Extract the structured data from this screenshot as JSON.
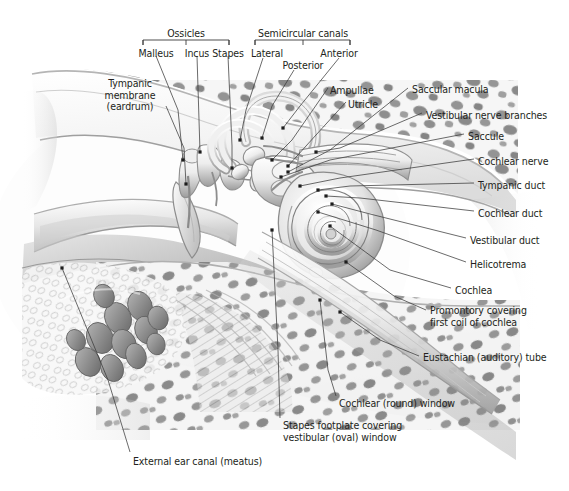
{
  "figure": {
    "width": 569,
    "height": 491,
    "background": "#ffffff",
    "line_color": "#3a3a3a",
    "text_color": "#231f20"
  },
  "group_brackets": [
    {
      "name": "ossicles",
      "label": "Ossicles",
      "x": 186,
      "y": 28,
      "left": 143,
      "right": 229,
      "stem_y": 40,
      "ticks": [
        143,
        186,
        229
      ]
    },
    {
      "name": "semicircular-canals",
      "label": "Semicircular canals",
      "x": 303,
      "y": 28,
      "left": 255,
      "right": 350,
      "stem_y": 40,
      "ticks": [
        255,
        303,
        350
      ]
    }
  ],
  "labels": [
    {
      "name": "malleus",
      "text": "Malleus",
      "x": 156,
      "y": 48,
      "align": "center"
    },
    {
      "name": "incus",
      "text": "Incus",
      "x": 197,
      "y": 48,
      "align": "center"
    },
    {
      "name": "stapes",
      "text": "Stapes",
      "x": 228,
      "y": 48,
      "align": "center"
    },
    {
      "name": "lateral",
      "text": "Lateral",
      "x": 267,
      "y": 48,
      "align": "center"
    },
    {
      "name": "anterior",
      "text": "Anterior",
      "x": 339,
      "y": 48,
      "align": "center"
    },
    {
      "name": "posterior",
      "text": "Posterior",
      "x": 303,
      "y": 60,
      "align": "center"
    },
    {
      "name": "tympanic-membrane",
      "text": "Tympanic\nmembrane\n(eardrum)",
      "x": 130,
      "y": 78,
      "align": "center"
    },
    {
      "name": "ampullae",
      "text": "Ampullae",
      "x": 330,
      "y": 85,
      "align": "left"
    },
    {
      "name": "utricle",
      "text": "Utricle",
      "x": 348,
      "y": 99,
      "align": "left"
    },
    {
      "name": "saccular-macula",
      "text": "Saccular macula",
      "x": 412,
      "y": 84,
      "align": "left"
    },
    {
      "name": "vestibular-nerve-branches",
      "text": "Vestibular nerve branches",
      "x": 426,
      "y": 110,
      "align": "left"
    },
    {
      "name": "saccule",
      "text": "Saccule",
      "x": 468,
      "y": 131,
      "align": "left"
    },
    {
      "name": "cochlear-nerve",
      "text": "Cochlear nerve",
      "x": 478,
      "y": 156,
      "align": "left"
    },
    {
      "name": "tympanic-duct",
      "text": "Tympanic duct",
      "x": 478,
      "y": 180,
      "align": "left"
    },
    {
      "name": "cochlear-duct",
      "text": "Cochlear duct",
      "x": 478,
      "y": 208,
      "align": "left"
    },
    {
      "name": "vestibular-duct",
      "text": "Vestibular duct",
      "x": 470,
      "y": 235,
      "align": "left"
    },
    {
      "name": "helicotrema",
      "text": "Helicotrema",
      "x": 470,
      "y": 259,
      "align": "left"
    },
    {
      "name": "cochlea",
      "text": "Cochlea",
      "x": 455,
      "y": 285,
      "align": "left"
    },
    {
      "name": "promontory",
      "text": "Promontory covering\nfirst coil of cochlea",
      "x": 430,
      "y": 305,
      "align": "left"
    },
    {
      "name": "eustachian-tube",
      "text": "Eustachian (auditory) tube",
      "x": 423,
      "y": 352,
      "align": "left"
    },
    {
      "name": "cochlear-round-window",
      "text": "Cochlear (round) window",
      "x": 339,
      "y": 398,
      "align": "left"
    },
    {
      "name": "stapes-footplate",
      "text": "Stapes footplate covering\nvestibular (oval) window",
      "x": 283,
      "y": 420,
      "align": "left"
    },
    {
      "name": "external-ear-canal",
      "text": "External ear canal (meatus)",
      "x": 133,
      "y": 456,
      "align": "left"
    }
  ],
  "leader_lines": [
    {
      "name": "leader-malleus",
      "points": "156,56 178,110 183,160",
      "dot": "183,160"
    },
    {
      "name": "leader-incus",
      "points": "197,56 200,152",
      "dot": "200,152"
    },
    {
      "name": "leader-stapes",
      "points": "228,56 232,146 232,168",
      "dot": "232,168"
    },
    {
      "name": "leader-lateral",
      "points": "263,58 246,110 240,140",
      "dot": "240,140"
    },
    {
      "name": "leader-posterior",
      "points": "294,70 272,106 262,138",
      "dot": "262,138"
    },
    {
      "name": "leader-anterior",
      "points": "339,58 300,106 283,128",
      "dot": "283,128"
    },
    {
      "name": "leader-tympanic-membrane",
      "points": "166,106 184,148 186,184",
      "dot": "186,184"
    },
    {
      "name": "leader-ampullae",
      "points": "328,88 292,140 272,160",
      "dot": "272,160"
    },
    {
      "name": "leader-utricle",
      "points": "346,102 306,146 288,166",
      "dot": "288,166"
    },
    {
      "name": "leader-saccular-macula",
      "points": "408,88 330,150 288,172",
      "dot": "288,172"
    },
    {
      "name": "leader-vestibular-nerve",
      "points": "422,113 340,148 316,152",
      "dot": "316,152"
    },
    {
      "name": "leader-saccule",
      "points": "464,134 330,160 281,177",
      "dot": "281,177"
    },
    {
      "name": "leader-cochlear-nerve",
      "points": "474,159 340,178 300,186",
      "dot": "300,186"
    },
    {
      "name": "leader-tympanic-duct",
      "points": "474,183 350,186 318,190",
      "dot": "318,190"
    },
    {
      "name": "leader-cochlear-duct",
      "points": "474,211 360,198 326,196",
      "dot": "326,196"
    },
    {
      "name": "leader-vestibular-duct",
      "points": "466,238 370,214 332,204",
      "dot": "332,204"
    },
    {
      "name": "leader-helicotrema",
      "points": "466,262 376,230 318,212",
      "dot": "318,212"
    },
    {
      "name": "leader-cochlea",
      "points": "451,288 390,270 330,226",
      "dot": "330,226"
    },
    {
      "name": "leader-promontory",
      "points": "426,310 394,296 346,262",
      "dot": "346,262"
    },
    {
      "name": "leader-eustachian",
      "points": "419,356 380,340 340,312",
      "dot": "340,312"
    },
    {
      "name": "leader-round-window",
      "points": "336,396 328,370 320,300",
      "dot": "320,300"
    },
    {
      "name": "leader-stapes-footplate",
      "points": "280,418 278,350 272,230",
      "dot": "272,230"
    },
    {
      "name": "leader-external-canal",
      "points": "130,452 108,380 62,268",
      "dot": "62,268"
    }
  ]
}
